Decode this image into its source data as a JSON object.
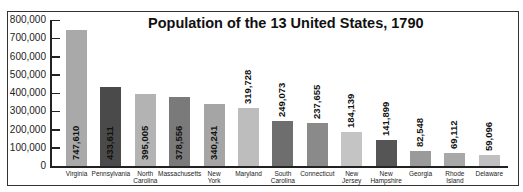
{
  "chart_data": {
    "type": "bar",
    "title": "Population of the 13 United States, 1790",
    "xlabel": "",
    "ylabel": "",
    "ylim": [
      0,
      800000
    ],
    "yticks": [
      0,
      100000,
      200000,
      300000,
      400000,
      500000,
      600000,
      700000,
      800000
    ],
    "ytick_labels": [
      "0",
      "100,000",
      "200,000",
      "300,000",
      "400,000",
      "500,000",
      "600,000",
      "700,000",
      "800,000"
    ],
    "grid": false,
    "legend": null,
    "categories": [
      "Virginia",
      "Pennsylvania",
      "North Carolina",
      "Massachusetts",
      "New York",
      "Maryland",
      "South Carolina",
      "Connecticut",
      "New Jersey",
      "New Hampshire",
      "Georgia",
      "Rhode Island",
      "Delaware"
    ],
    "values": [
      747610,
      433611,
      395005,
      378556,
      340241,
      319728,
      249073,
      237655,
      184139,
      141899,
      82548,
      69112,
      59096
    ],
    "value_labels": [
      "747,610",
      "433,611",
      "395,005",
      "378,556",
      "340,241",
      "319,728",
      "249,073",
      "237,655",
      "184,139",
      "141,899",
      "82,548",
      "69,112",
      "59,096"
    ],
    "label_lines": [
      [
        "Virginia"
      ],
      [
        "Pennsylvania"
      ],
      [
        "North",
        "Carolina"
      ],
      [
        "Massachusetts"
      ],
      [
        "New",
        "York"
      ],
      [
        "Maryland"
      ],
      [
        "South",
        "Carolina"
      ],
      [
        "Connecticut"
      ],
      [
        "New",
        "Jersey"
      ],
      [
        "New",
        "Hampshire"
      ],
      [
        "Georgia"
      ],
      [
        "Rhode",
        "Island"
      ],
      [
        "Delaware"
      ]
    ],
    "colors": [
      "#a9a9a9",
      "#4a4a4a",
      "#b3b3b3",
      "#7a7a7a",
      "#a5a5a5",
      "#bdbdbd",
      "#6e6e6e",
      "#8a8a8a",
      "#c4c4c4",
      "#555555",
      "#9a9a9a",
      "#a8a8a8",
      "#c0c0c0"
    ]
  }
}
